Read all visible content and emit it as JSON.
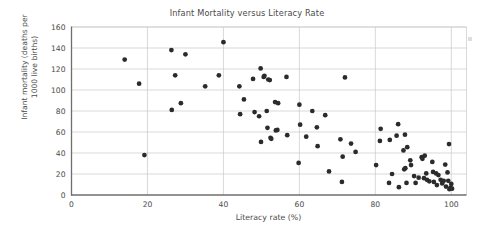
{
  "chart_data": {
    "type": "scatter",
    "title": "Infant Mortality versus Literacy Rate",
    "xlabel": "Literacy rate (%)",
    "ylabel": "Infant mortality (deaths per 1000 live births)",
    "ylabel_line1": "Infant mortality (deaths per",
    "ylabel_line2": "1000 live births)",
    "xlim": [
      0,
      104
    ],
    "ylim": [
      0,
      160
    ],
    "xticks": [
      0,
      20,
      40,
      60,
      80,
      100
    ],
    "yticks": [
      0,
      20,
      40,
      60,
      80,
      100,
      120,
      140,
      160
    ],
    "xtick_labels": [
      "0",
      "20",
      "40",
      "60",
      "80",
      "100"
    ],
    "ytick_labels": [
      "0",
      "20",
      "40",
      "60",
      "80",
      "100",
      "120",
      "140",
      "160"
    ],
    "grid": "horizontal-and-major-vertical",
    "legend": "none",
    "marker": "filled-circle",
    "marker_color": "#2b2b2b",
    "marker_size": 3.2,
    "axis_color": "#6e6e6e",
    "grid_color": "#c9c9c9",
    "background_color": "#ffffff",
    "points": [
      [
        14.0,
        129.0
      ],
      [
        17.8,
        106.0
      ],
      [
        19.2,
        38.0
      ],
      [
        26.3,
        138.0
      ],
      [
        26.4,
        81.0
      ],
      [
        27.3,
        114.0
      ],
      [
        28.8,
        87.5
      ],
      [
        30.0,
        134.0
      ],
      [
        35.2,
        103.5
      ],
      [
        38.8,
        114.0
      ],
      [
        40.0,
        145.5
      ],
      [
        44.2,
        103.5
      ],
      [
        44.4,
        77.0
      ],
      [
        45.4,
        91.0
      ],
      [
        47.8,
        110.5
      ],
      [
        48.2,
        79.0
      ],
      [
        49.4,
        75.0
      ],
      [
        49.8,
        120.5
      ],
      [
        49.9,
        50.5
      ],
      [
        50.6,
        112.5
      ],
      [
        50.8,
        113.5
      ],
      [
        51.4,
        80.0
      ],
      [
        51.6,
        64.0
      ],
      [
        51.8,
        110.0
      ],
      [
        52.2,
        109.5
      ],
      [
        52.4,
        54.5
      ],
      [
        52.6,
        53.5
      ],
      [
        53.6,
        88.5
      ],
      [
        53.8,
        61.5
      ],
      [
        54.2,
        62.0
      ],
      [
        54.4,
        87.5
      ],
      [
        56.6,
        112.5
      ],
      [
        56.8,
        57.0
      ],
      [
        59.8,
        30.5
      ],
      [
        60.0,
        86.0
      ],
      [
        60.2,
        67.0
      ],
      [
        61.8,
        55.5
      ],
      [
        63.4,
        80.0
      ],
      [
        64.6,
        64.5
      ],
      [
        64.8,
        46.5
      ],
      [
        66.8,
        76.0
      ],
      [
        67.8,
        22.5
      ],
      [
        70.8,
        53.0
      ],
      [
        71.2,
        12.5
      ],
      [
        71.4,
        36.5
      ],
      [
        72.0,
        112.0
      ],
      [
        73.6,
        49.0
      ],
      [
        74.8,
        41.0
      ],
      [
        80.2,
        28.5
      ],
      [
        81.2,
        51.5
      ],
      [
        81.4,
        63.0
      ],
      [
        83.6,
        11.5
      ],
      [
        83.8,
        52.5
      ],
      [
        84.4,
        20.0
      ],
      [
        85.6,
        56.5
      ],
      [
        86.0,
        67.5
      ],
      [
        86.2,
        7.5
      ],
      [
        87.4,
        42.5
      ],
      [
        87.6,
        24.5
      ],
      [
        87.8,
        57.5
      ],
      [
        87.9,
        25.5
      ],
      [
        88.2,
        11.5
      ],
      [
        88.4,
        45.5
      ],
      [
        89.2,
        33.0
      ],
      [
        89.4,
        28.5
      ],
      [
        90.2,
        18.0
      ],
      [
        90.6,
        11.5
      ],
      [
        91.4,
        16.5
      ],
      [
        92.2,
        36.0
      ],
      [
        92.4,
        34.5
      ],
      [
        92.8,
        16.0
      ],
      [
        93.0,
        37.5
      ],
      [
        93.4,
        20.5
      ],
      [
        93.6,
        14.5
      ],
      [
        94.2,
        13.0
      ],
      [
        95.0,
        31.5
      ],
      [
        95.2,
        22.0
      ],
      [
        95.4,
        12.5
      ],
      [
        96.0,
        20.5
      ],
      [
        96.2,
        9.5
      ],
      [
        96.6,
        19.0
      ],
      [
        97.2,
        14.5
      ],
      [
        97.6,
        11.0
      ],
      [
        98.0,
        13.5
      ],
      [
        98.4,
        29.0
      ],
      [
        98.6,
        8.0
      ],
      [
        99.0,
        21.5
      ],
      [
        99.2,
        13.5
      ],
      [
        99.4,
        48.5
      ],
      [
        99.5,
        5.5
      ],
      [
        99.8,
        7.0
      ],
      [
        100.0,
        10.5
      ],
      [
        100.2,
        6.0
      ]
    ]
  }
}
